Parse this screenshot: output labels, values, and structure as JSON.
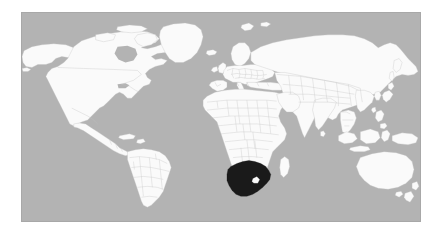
{
  "map": {
    "title": "World locator map",
    "projection": "equirectangular",
    "highlighted_country": "South Africa",
    "enclave_country": "Lesotho",
    "colors": {
      "ocean": "#b3b3b3",
      "land": "#fafafa",
      "border": "#c2c2c2",
      "highlight": "#1a1a1a",
      "frame": "#a8a8a8",
      "page_background": "#ffffff"
    },
    "frame": {
      "x": 21,
      "y": 12,
      "width": 400,
      "height": 210
    },
    "regions": [
      {
        "name": "north-america",
        "label": "North America"
      },
      {
        "name": "south-america",
        "label": "South America"
      },
      {
        "name": "greenland",
        "label": "Greenland"
      },
      {
        "name": "europe",
        "label": "Europe"
      },
      {
        "name": "africa",
        "label": "Africa"
      },
      {
        "name": "asia",
        "label": "Asia"
      },
      {
        "name": "australia",
        "label": "Australia"
      },
      {
        "name": "new-zealand",
        "label": "New Zealand"
      },
      {
        "name": "indonesia",
        "label": "Indonesia"
      },
      {
        "name": "japan",
        "label": "Japan"
      },
      {
        "name": "madagascar",
        "label": "Madagascar"
      },
      {
        "name": "iceland",
        "label": "Iceland"
      },
      {
        "name": "svalbard",
        "label": "Svalbard"
      },
      {
        "name": "british-isles",
        "label": "British Isles"
      },
      {
        "name": "philippines",
        "label": "Philippines"
      },
      {
        "name": "sri-lanka",
        "label": "Sri Lanka"
      },
      {
        "name": "new-guinea",
        "label": "New Guinea"
      },
      {
        "name": "caribbean",
        "label": "Caribbean"
      },
      {
        "name": "south-africa",
        "label": "South Africa"
      },
      {
        "name": "lesotho",
        "label": "Lesotho"
      }
    ]
  }
}
